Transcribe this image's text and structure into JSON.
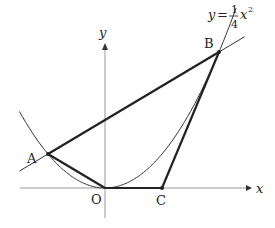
{
  "diagram": {
    "curve": {
      "equation_lhs": "y",
      "equation_eq": "=",
      "coef_num": "1",
      "coef_den": "4",
      "var": "x",
      "exponent": "2",
      "a": 0.25
    },
    "axes": {
      "x_label": "x",
      "y_label": "y",
      "origin_label": "O"
    },
    "points": [
      {
        "name": "A",
        "x": -2,
        "y": 1
      },
      {
        "name": "B",
        "x": 4,
        "y": 4
      },
      {
        "name": "C",
        "x": 2,
        "y": 0
      },
      {
        "name": "O",
        "x": 0,
        "y": 0
      }
    ],
    "segments": [
      [
        "A",
        "B"
      ],
      [
        "A",
        "O"
      ],
      [
        "O",
        "C"
      ],
      [
        "C",
        "B"
      ]
    ],
    "line": {
      "through": [
        "A",
        "B"
      ],
      "slope": 0.5,
      "intercept": 2
    },
    "colors": {
      "stroke": "#222222",
      "axis": "#999999"
    }
  }
}
